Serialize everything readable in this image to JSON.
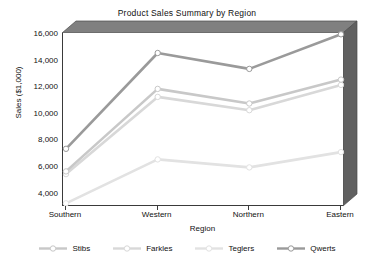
{
  "chart_data": {
    "type": "line",
    "title": "Product Sales Summary by Region",
    "xlabel": "Region",
    "ylabel": "Sales ($1,000)",
    "categories": [
      "Southern",
      "Western",
      "Northern",
      "Eastern"
    ],
    "ylim": [
      3000,
      16000
    ],
    "yticks": [
      4000,
      6000,
      8000,
      10000,
      12000,
      14000,
      16000
    ],
    "ytick_labels": [
      "4,000",
      "6,000",
      "8,000",
      "10,000",
      "12,000",
      "14,000",
      "16,000"
    ],
    "grid": false,
    "legend_position": "bottom",
    "marker": "circle",
    "style_3d": true,
    "series": [
      {
        "name": "Stibs",
        "color": "#c8c8c8",
        "marker_color": "#ffffff",
        "values": [
          5600,
          11800,
          10700,
          12500
        ]
      },
      {
        "name": "Farkles",
        "color": "#d8d8d8",
        "marker_color": "#ffffff",
        "values": [
          5400,
          11200,
          10200,
          12100
        ]
      },
      {
        "name": "Teglers",
        "color": "#e2e2e2",
        "marker_color": "#ffffff",
        "values": [
          3200,
          6500,
          5900,
          7050
        ]
      },
      {
        "name": "Qwerts",
        "color": "#9a9a9a",
        "marker_color": "#ffffff",
        "values": [
          7300,
          14500,
          13300,
          15900
        ]
      }
    ]
  },
  "frame": {
    "top_wall_color": "#808080",
    "right_wall_color": "#606060",
    "axis_color": "#3a3a3a",
    "plot_background": "#ffffff"
  }
}
